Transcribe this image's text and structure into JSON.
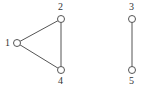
{
  "diagram": {
    "type": "undirected-graph",
    "nodes": [
      {
        "id": "1",
        "label": "1",
        "x": 17,
        "y": 43,
        "label_x": 5,
        "label_y": 46
      },
      {
        "id": "2",
        "label": "2",
        "x": 61,
        "y": 19,
        "label_x": 58,
        "label_y": 10
      },
      {
        "id": "3",
        "label": "3",
        "x": 132,
        "y": 19,
        "label_x": 129,
        "label_y": 10
      },
      {
        "id": "4",
        "label": "4",
        "x": 61,
        "y": 70,
        "label_x": 58,
        "label_y": 84
      },
      {
        "id": "5",
        "label": "5",
        "x": 132,
        "y": 70,
        "label_x": 129,
        "label_y": 84
      }
    ],
    "edges": [
      {
        "from": "1",
        "to": "2"
      },
      {
        "from": "1",
        "to": "4"
      },
      {
        "from": "2",
        "to": "4"
      },
      {
        "from": "3",
        "to": "5"
      }
    ],
    "node_radius": 3.5,
    "colors": {
      "stroke": "#555555",
      "label": "#333333",
      "background": "#ffffff"
    }
  }
}
